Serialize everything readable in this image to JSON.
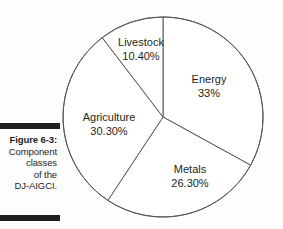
{
  "figure": {
    "caption_title": "Figure 6-3:",
    "caption_lines": [
      "Component",
      "classes",
      "of the",
      "DJ-AIGCI."
    ],
    "rule_color": "#231f20"
  },
  "chart_data": {
    "type": "pie",
    "title": "",
    "subtitle": "",
    "xlabel": "",
    "ylabel": "",
    "grid": false,
    "legend": "none",
    "start_angle_deg": 0,
    "direction": "clockwise",
    "center": [
      163,
      117
    ],
    "radius": 100,
    "stroke_color": "#58595b",
    "fill_color": "#ffffff",
    "categories": [
      "Energy",
      "Metals",
      "Agriculture",
      "Livestock"
    ],
    "values": [
      33,
      26.3,
      30.3,
      10.4
    ],
    "value_labels": [
      "33%",
      "26.30%",
      "30.30%",
      "10.40%"
    ],
    "slices": [
      {
        "name": "Energy",
        "value": 33,
        "value_label": "33%",
        "start_deg": 0,
        "end_deg": 118.8,
        "label_x": 209,
        "label_y": 83,
        "value_x": 209,
        "value_y": 97
      },
      {
        "name": "Metals",
        "value": 26.3,
        "value_label": "26.30%",
        "start_deg": 118.8,
        "end_deg": 213.48,
        "label_x": 190,
        "label_y": 173,
        "value_x": 190,
        "value_y": 187
      },
      {
        "name": "Agriculture",
        "value": 30.3,
        "value_label": "30.30%",
        "start_deg": 213.48,
        "end_deg": 322.56,
        "label_x": 109,
        "label_y": 121,
        "value_x": 109,
        "value_y": 135
      },
      {
        "name": "Livestock",
        "value": 10.4,
        "value_label": "10.40%",
        "start_deg": 322.56,
        "end_deg": 360,
        "label_x": 141,
        "label_y": 46,
        "value_x": 141,
        "value_y": 60
      }
    ]
  }
}
